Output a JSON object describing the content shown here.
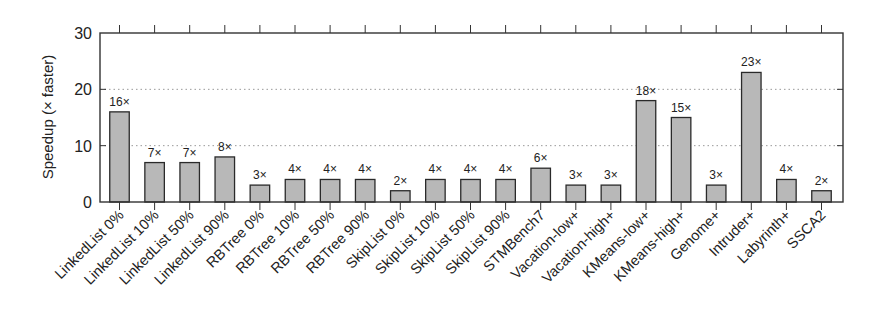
{
  "chart_data": {
    "type": "bar",
    "title": "",
    "xlabel": "",
    "ylabel": "Speedup (× faster)",
    "ylim": [
      0,
      30
    ],
    "yticks": [
      0,
      10,
      20,
      30
    ],
    "grid": {
      "y": true,
      "style": "dotted",
      "lines_at": [
        10,
        20
      ]
    },
    "legend": null,
    "categories": [
      "LinkedList 0%",
      "LinkedList 10%",
      "LinkedList 50%",
      "LinkedList 90%",
      "RBTree 0%",
      "RBTree 10%",
      "RBTree 50%",
      "RBTree 90%",
      "SkipList 0%",
      "SkipList 10%",
      "SkipList 50%",
      "SkipList 90%",
      "STMBench7",
      "Vacation-low+",
      "Vacation-high+",
      "KMeans-low+",
      "KMeans-high+",
      "Genome+",
      "Intruder+",
      "Labyrinth+",
      "SSCA2"
    ],
    "values": [
      16,
      7,
      7,
      8,
      3,
      4,
      4,
      4,
      2,
      4,
      4,
      4,
      6,
      3,
      3,
      18,
      15,
      3,
      23,
      4,
      2
    ],
    "bar_labels": [
      "16×",
      "7×",
      "7×",
      "8×",
      "3×",
      "4×",
      "4×",
      "4×",
      "2×",
      "4×",
      "4×",
      "4×",
      "6×",
      "3×",
      "3×",
      "18×",
      "15×",
      "3×",
      "23×",
      "4×",
      "2×"
    ],
    "colors": {
      "bar_fill": "#b8b8b8",
      "bar_stroke": "#2a2a2a",
      "axis": "#333333",
      "grid": "#999999"
    }
  }
}
